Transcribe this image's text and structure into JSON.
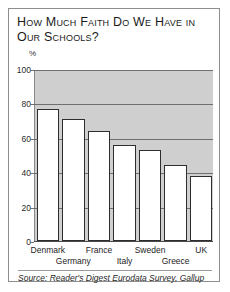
{
  "chart_data": {
    "type": "bar",
    "title": "How Much Faith Do We Have in Our Schools?",
    "xlabel": "",
    "ylabel": "%",
    "ylim": [
      0,
      100
    ],
    "yticks": [
      0,
      20,
      40,
      60,
      80,
      100
    ],
    "grid": true,
    "legend": "none",
    "categories": [
      "Denmark",
      "Germany",
      "France",
      "Italy",
      "Sweden",
      "Greece",
      "UK"
    ],
    "values": [
      77,
      71,
      64,
      56,
      53,
      44,
      38
    ],
    "annotations": {
      "source": "Source: Reader's Digest Eurodata Survey, Gallup",
      "unit_label": "%"
    },
    "colors": {
      "bar_fill": "#ffffff",
      "bar_edge": "#2e2e2e",
      "plot_band": "#cfcfcf",
      "gridline": "#6f6f6f",
      "frame": "#8d8d8d",
      "text": "#1a1a1a"
    }
  }
}
